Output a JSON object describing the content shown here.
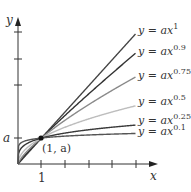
{
  "chart_data": {
    "type": "line",
    "title": "",
    "xlabel": "x",
    "ylabel": "y",
    "function_family": "y = a x^p",
    "x_tick_labels": [
      "1"
    ],
    "y_tick_labels": [
      "a"
    ],
    "x_ticks": [
      1,
      2,
      3,
      4,
      5
    ],
    "y_ticks_in_units_of_a": [
      1,
      3,
      4,
      5
    ],
    "xlim": [
      0,
      5.5
    ],
    "ylim_in_units_of_a": [
      0,
      5.5
    ],
    "grid": false,
    "legend_position": "inline labels at right end of curves",
    "annotation": {
      "text": "(1, a)",
      "x": 1,
      "y": "a"
    },
    "series": [
      {
        "name": "y = ax^1",
        "exponent": 1,
        "color": "#444444",
        "x": [
          0,
          5
        ],
        "y_over_a": [
          0,
          5.0
        ]
      },
      {
        "name": "y = ax^0.9",
        "exponent": 0.9,
        "color": "#333333",
        "x": [
          0,
          5
        ],
        "y_over_a": [
          0,
          4.26
        ]
      },
      {
        "name": "y = ax^0.75",
        "exponent": 0.75,
        "color": "#8a8a8a",
        "x": [
          0,
          5
        ],
        "y_over_a": [
          0,
          3.34
        ]
      },
      {
        "name": "y = ax^0.5",
        "exponent": 0.5,
        "color": "#bdbdbd",
        "x": [
          0,
          5
        ],
        "y_over_a": [
          0,
          2.24
        ]
      },
      {
        "name": "y = ax^0.25",
        "exponent": 0.25,
        "color": "#3a3a3a",
        "x": [
          0,
          5
        ],
        "y_over_a": [
          0,
          1.5
        ]
      },
      {
        "name": "y = ax^0.1",
        "exponent": 0.1,
        "color": "#555555",
        "x": [
          0,
          5
        ],
        "y_over_a": [
          0,
          1.17
        ]
      }
    ]
  },
  "labels": {
    "x_axis": "x",
    "y_axis": "y",
    "x_tick_1": "1",
    "y_tick_a": "a",
    "point": "(1, a)",
    "curves": [
      {
        "prefix": "y = ax",
        "exp": "1"
      },
      {
        "prefix": "y = ax",
        "exp": "0.9"
      },
      {
        "prefix": "y = ax",
        "exp": "0.75"
      },
      {
        "prefix": "y = ax",
        "exp": "0.5"
      },
      {
        "prefix": "y = ax",
        "exp": "0.25"
      },
      {
        "prefix": "y = ax",
        "exp": "0.1"
      }
    ]
  }
}
